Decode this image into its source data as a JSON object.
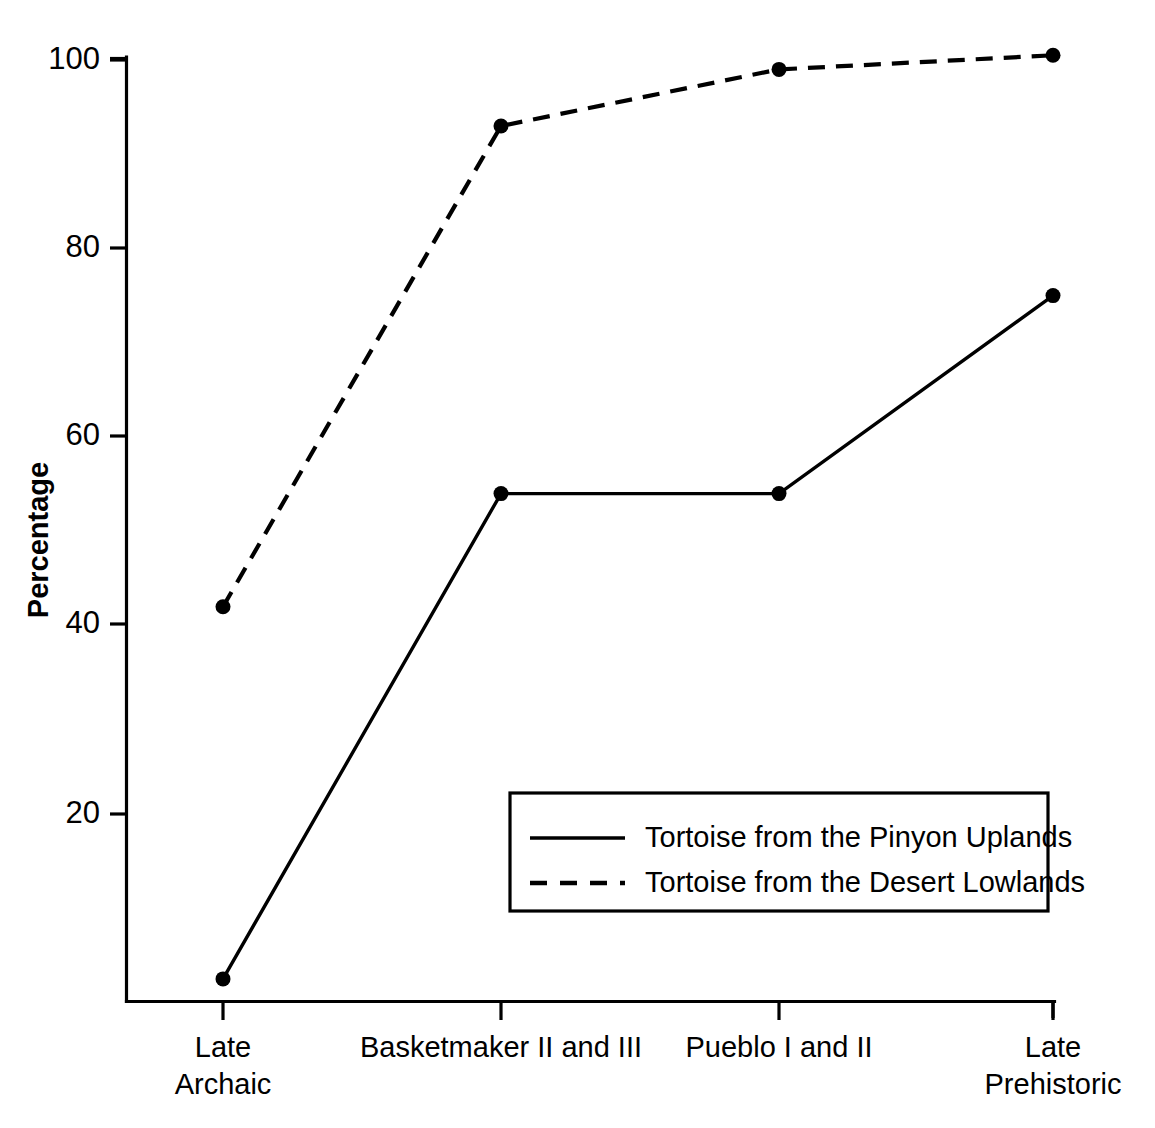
{
  "chart_data": {
    "type": "line",
    "title": "",
    "subtitle": "",
    "xlabel": "",
    "ylabel": "Percentage",
    "categories": [
      "Late\nArchaic",
      "Basketmaker II and III",
      "Pueblo I and II",
      "Late\nPrehistoric"
    ],
    "category_lines": [
      [
        "Late",
        "Archaic"
      ],
      [
        "Basketmaker II and III"
      ],
      [
        "Pueblo I and II"
      ],
      [
        "Late",
        "Prehistoric"
      ]
    ],
    "series": [
      {
        "name": "Tortoise from the Pinyon Uplands",
        "style": "solid",
        "color": "#000000",
        "marker": "circle",
        "values": [
          2.5,
          54,
          54,
          75
        ]
      },
      {
        "name": "Tortoise from the Desert Lowlands",
        "style": "dashed",
        "color": "#000000",
        "marker": "circle",
        "values": [
          42,
          93,
          99,
          100.5
        ]
      }
    ],
    "ylim": [
      -4,
      104
    ],
    "yticks": [
      20,
      40,
      60,
      80,
      100
    ],
    "ytick_labels": [
      "20",
      "40",
      "60",
      "80",
      "100"
    ],
    "grid": false,
    "legend_position": "bottom-right",
    "background_color": "#ffffff",
    "axis_color": "#000000"
  },
  "legend": {
    "entries": [
      {
        "label": "Tortoise from the Pinyon Uplands",
        "style": "solid"
      },
      {
        "label": "Tortoise from the Desert Lowlands",
        "style": "dashed"
      }
    ]
  }
}
